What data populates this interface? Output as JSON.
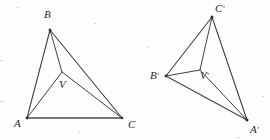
{
  "figure": {
    "background_color": "#fefefe",
    "line_color": "#3a3a3a",
    "label_color": "#262626",
    "width": 270,
    "height": 140
  },
  "left_figure": {
    "name": "triangle-ABC",
    "vertices": [
      {
        "id": "A",
        "label": "A",
        "prime": "",
        "x": 27,
        "y": 118,
        "label_x": 14,
        "label_y": 127
      },
      {
        "id": "B",
        "label": "B",
        "prime": "",
        "x": 50,
        "y": 30,
        "label_x": 44,
        "label_y": 18
      },
      {
        "id": "C",
        "label": "C",
        "prime": "",
        "x": 122,
        "y": 118,
        "label_x": 128,
        "label_y": 128
      },
      {
        "id": "V",
        "label": "V",
        "prime": "",
        "x": 62,
        "y": 72,
        "label_x": 59,
        "label_y": 88
      }
    ],
    "outer_edges": [
      {
        "from": "A",
        "to": "B"
      },
      {
        "from": "B",
        "to": "C"
      },
      {
        "from": "A",
        "to": "C"
      }
    ],
    "inner_edges": [
      {
        "from": "V",
        "to": "A"
      },
      {
        "from": "V",
        "to": "B"
      },
      {
        "from": "V",
        "to": "C"
      }
    ]
  },
  "right_figure": {
    "name": "triangle-A-prime-B-prime-C-prime",
    "vertices": [
      {
        "id": "Ap",
        "label": "A",
        "prime": "′",
        "x": 247,
        "y": 120,
        "label_x": 250,
        "label_y": 133
      },
      {
        "id": "Bp",
        "label": "B",
        "prime": "′",
        "x": 166,
        "y": 76,
        "label_x": 150,
        "label_y": 79
      },
      {
        "id": "Cp",
        "label": "C",
        "prime": "′",
        "x": 212,
        "y": 17,
        "label_x": 215,
        "label_y": 12
      },
      {
        "id": "Vp",
        "label": "V",
        "prime": "′",
        "x": 200,
        "y": 70,
        "label_x": 200,
        "label_y": 79
      }
    ],
    "outer_edges": [
      {
        "from": "Bp",
        "to": "Cp"
      },
      {
        "from": "Cp",
        "to": "Ap"
      },
      {
        "from": "Bp",
        "to": "Ap"
      }
    ],
    "inner_edges": [
      {
        "from": "Vp",
        "to": "Bp"
      },
      {
        "from": "Vp",
        "to": "Cp"
      },
      {
        "from": "Vp",
        "to": "Ap"
      }
    ]
  }
}
